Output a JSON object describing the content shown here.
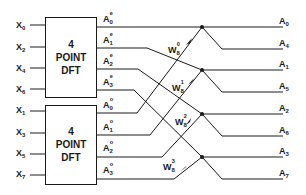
{
  "diagram": {
    "type": "8-point FFT decimation-in-time butterfly",
    "blocks": [
      {
        "id": "dft-top",
        "lines": [
          "4",
          "POINT",
          "DFT"
        ]
      },
      {
        "id": "dft-bottom",
        "lines": [
          "4",
          "POINT",
          "DFT"
        ]
      }
    ],
    "inputs_top": [
      {
        "base": "X",
        "sub": "0"
      },
      {
        "base": "X",
        "sub": "2"
      },
      {
        "base": "X",
        "sub": "4"
      },
      {
        "base": "X",
        "sub": "6"
      }
    ],
    "inputs_bottom": [
      {
        "base": "X",
        "sub": "1"
      },
      {
        "base": "X",
        "sub": "3"
      },
      {
        "base": "X",
        "sub": "5"
      },
      {
        "base": "X",
        "sub": "7"
      }
    ],
    "block_outputs_top": [
      {
        "base": "A",
        "sub": "0",
        "sup": "e"
      },
      {
        "base": "A",
        "sub": "1",
        "sup": "e"
      },
      {
        "base": "A",
        "sub": "2",
        "sup": "e"
      },
      {
        "base": "A",
        "sub": "3",
        "sup": "e"
      }
    ],
    "block_outputs_bottom": [
      {
        "base": "A",
        "sub": "0",
        "sup": "o"
      },
      {
        "base": "A",
        "sub": "1",
        "sup": "o"
      },
      {
        "base": "A",
        "sub": "2",
        "sup": "o"
      },
      {
        "base": "A",
        "sub": "3",
        "sup": "o"
      }
    ],
    "twiddles": [
      {
        "base": "W",
        "sub": "8",
        "sup": "0"
      },
      {
        "base": "W",
        "sub": "8",
        "sup": "1"
      },
      {
        "base": "W",
        "sub": "8",
        "sup": "2"
      },
      {
        "base": "W",
        "sub": "8",
        "sup": "3"
      }
    ],
    "outputs": [
      {
        "base": "A",
        "sub": "0"
      },
      {
        "base": "A",
        "sub": "4"
      },
      {
        "base": "A",
        "sub": "1"
      },
      {
        "base": "A",
        "sub": "5"
      },
      {
        "base": "A",
        "sub": "2"
      },
      {
        "base": "A",
        "sub": "6"
      },
      {
        "base": "A",
        "sub": "3"
      },
      {
        "base": "A",
        "sub": "7"
      }
    ],
    "colors": {
      "line": "#1a1a1a",
      "background": "#ffffff"
    }
  }
}
